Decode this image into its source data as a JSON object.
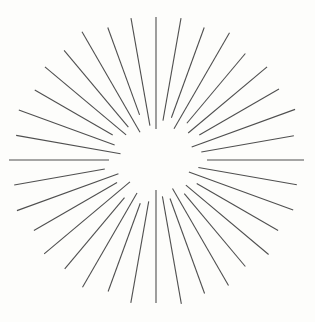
{
  "figure": {
    "background_color": "#fdfdfb",
    "line_color": "#4f4f4f",
    "line_width": 1.1,
    "width": 315,
    "height": 322
  },
  "chart_data": {
    "type": "scatter",
    "subtitle": "",
    "xlabel": "",
    "ylabel": "",
    "grid": false,
    "legend": null,
    "center": {
      "x": 156,
      "y": 160
    },
    "ray_count": 36,
    "angle_step_degrees": 10,
    "inner_radius_range": [
      28,
      53
    ],
    "outer_radius_range": [
      138,
      150
    ],
    "xlim": [
      0,
      315
    ],
    "ylim": [
      0,
      322
    ],
    "rays": [
      {
        "angle": 0,
        "inner_radius": 31,
        "outer_radius": 143
      },
      {
        "angle": 10,
        "inner_radius": 40,
        "outer_radius": 144
      },
      {
        "angle": 20,
        "inner_radius": 45,
        "outer_radius": 141
      },
      {
        "angle": 30,
        "inner_radius": 36,
        "outer_radius": 147
      },
      {
        "angle": 40,
        "inner_radius": 48,
        "outer_radius": 139
      },
      {
        "angle": 50,
        "inner_radius": 42,
        "outer_radius": 145
      },
      {
        "angle": 60,
        "inner_radius": 50,
        "outer_radius": 142
      },
      {
        "angle": 70,
        "inner_radius": 38,
        "outer_radius": 148
      },
      {
        "angle": 80,
        "inner_radius": 46,
        "outer_radius": 140
      },
      {
        "angle": 90,
        "inner_radius": 51,
        "outer_radius": 148
      },
      {
        "angle": 100,
        "inner_radius": 43,
        "outer_radius": 143
      },
      {
        "angle": 110,
        "inner_radius": 35,
        "outer_radius": 146
      },
      {
        "angle": 120,
        "inner_radius": 47,
        "outer_radius": 141
      },
      {
        "angle": 130,
        "inner_radius": 39,
        "outer_radius": 147
      },
      {
        "angle": 140,
        "inner_radius": 44,
        "outer_radius": 139
      },
      {
        "angle": 150,
        "inner_radius": 33,
        "outer_radius": 145
      },
      {
        "angle": 160,
        "inner_radius": 41,
        "outer_radius": 142
      },
      {
        "angle": 170,
        "inner_radius": 37,
        "outer_radius": 146
      },
      {
        "angle": 180,
        "inner_radius": 30,
        "outer_radius": 143
      },
      {
        "angle": 190,
        "inner_radius": 42,
        "outer_radius": 145
      },
      {
        "angle": 200,
        "inner_radius": 46,
        "outer_radius": 140
      },
      {
        "angle": 210,
        "inner_radius": 38,
        "outer_radius": 147
      },
      {
        "angle": 220,
        "inner_radius": 49,
        "outer_radius": 142
      },
      {
        "angle": 230,
        "inner_radius": 34,
        "outer_radius": 146
      },
      {
        "angle": 240,
        "inner_radius": 45,
        "outer_radius": 141
      },
      {
        "angle": 250,
        "inner_radius": 40,
        "outer_radius": 148
      },
      {
        "angle": 260,
        "inner_radius": 52,
        "outer_radius": 144
      },
      {
        "angle": 270,
        "inner_radius": 47,
        "outer_radius": 147
      },
      {
        "angle": 280,
        "inner_radius": 36,
        "outer_radius": 142
      },
      {
        "angle": 290,
        "inner_radius": 44,
        "outer_radius": 146
      },
      {
        "angle": 300,
        "inner_radius": 50,
        "outer_radius": 140
      },
      {
        "angle": 310,
        "inner_radius": 39,
        "outer_radius": 145
      },
      {
        "angle": 320,
        "inner_radius": 43,
        "outer_radius": 143
      },
      {
        "angle": 330,
        "inner_radius": 32,
        "outer_radius": 148
      },
      {
        "angle": 340,
        "inner_radius": 48,
        "outer_radius": 141
      },
      {
        "angle": 350,
        "inner_radius": 35,
        "outer_radius": 144
      }
    ]
  }
}
